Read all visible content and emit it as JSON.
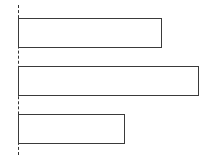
{
  "chart_data": {
    "type": "bar",
    "orientation": "horizontal",
    "title": "",
    "xlabel": "",
    "ylabel": "",
    "categories": [
      "",
      "",
      ""
    ],
    "values": [
      144,
      181,
      107
    ],
    "xlim": [
      0,
      190
    ],
    "grid": false,
    "legend": null,
    "baseline_style": "dashed",
    "bar_fill": "#ffffff",
    "bar_edge": "#3a3a3a"
  },
  "layout": {
    "baseline_x": 18,
    "px_per_unit": 1,
    "bars": [
      {
        "top": 18,
        "height": 30
      },
      {
        "top": 66,
        "height": 30
      },
      {
        "top": 114,
        "height": 30
      }
    ]
  }
}
